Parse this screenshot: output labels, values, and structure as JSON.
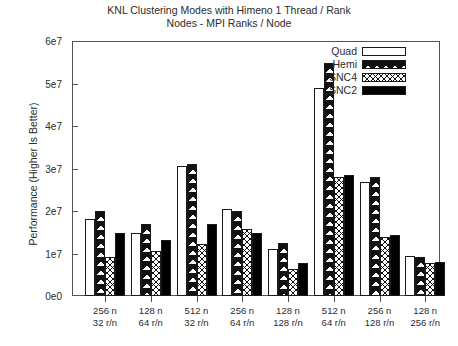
{
  "chart_data": {
    "type": "bar",
    "title": "KNL Clustering Modes with Himeno 1 Thread / Rank\nNodes - MPI Ranks / Node",
    "title_line1": "KNL Clustering Modes with Himeno 1 Thread / Rank",
    "title_line2": "Nodes - MPI Ranks / Node",
    "xlabel": "",
    "ylabel": "Performance (Higher Is Better)",
    "ylim": [
      0,
      60000000
    ],
    "ytick_labels": [
      "0e0",
      "1e7",
      "2e7",
      "3e7",
      "4e7",
      "5e7",
      "6e7"
    ],
    "ytick_values": [
      0,
      10000000,
      20000000,
      30000000,
      40000000,
      50000000,
      60000000
    ],
    "grid": false,
    "legend_position": "top-right",
    "categories": [
      "256 n\n32 r/n",
      "128 n\n64 r/n",
      "512 n\n32 r/n",
      "256 n\n64 r/n",
      "128 n\n128 r/n",
      "512 n\n64 r/n",
      "256 n\n128 r/n",
      "128 n\n256 r/n"
    ],
    "category_lines": [
      {
        "nodes": "256 n",
        "ranks": "32 r/n"
      },
      {
        "nodes": "128 n",
        "ranks": "64 r/n"
      },
      {
        "nodes": "512 n",
        "ranks": "32 r/n"
      },
      {
        "nodes": "256 n",
        "ranks": "64 r/n"
      },
      {
        "nodes": "128 n",
        "ranks": "128 r/n"
      },
      {
        "nodes": "512 n",
        "ranks": "64 r/n"
      },
      {
        "nodes": "256 n",
        "ranks": "128 r/n"
      },
      {
        "nodes": "128 n",
        "ranks": "256 r/n"
      }
    ],
    "series": [
      {
        "name": "Quad",
        "fill": "empty",
        "values": [
          18100000,
          14800000,
          30600000,
          20500000,
          11100000,
          49200000,
          27000000,
          9400000
        ]
      },
      {
        "name": "Hemi",
        "fill": "cross-hatch-large",
        "values": [
          20000000,
          16900000,
          31300000,
          20000000,
          12500000,
          55000000,
          28000000,
          9200000
        ]
      },
      {
        "name": "SNC4",
        "fill": "cross-hatch-dense",
        "values": [
          9200000,
          10600000,
          12200000,
          15800000,
          6300000,
          28000000,
          13900000,
          7800000
        ]
      },
      {
        "name": "SNC2",
        "fill": "solid-black",
        "values": [
          14800000,
          13200000,
          16900000,
          14800000,
          7800000,
          28500000,
          14400000,
          8000000
        ]
      }
    ]
  },
  "colors": {
    "axis": "#555555",
    "text": "#2b2b2b",
    "bar_outline": "#1a1a1a",
    "solid_series": "#000000",
    "background": "#ffffff"
  }
}
